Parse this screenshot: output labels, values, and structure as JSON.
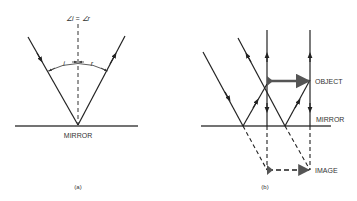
{
  "panel_a": {
    "angle_label": "∠i = ∠r",
    "incidence_label": "i",
    "reflection_label": "r",
    "mirror_label": "MIRROR",
    "caption": "(a)"
  },
  "panel_b": {
    "object_label": "OBJECT",
    "mirror_label": "MIRROR",
    "image_label": "IMAGE",
    "caption": "(b)"
  },
  "colors": {
    "line": "#222222",
    "arrow": "#555555"
  }
}
